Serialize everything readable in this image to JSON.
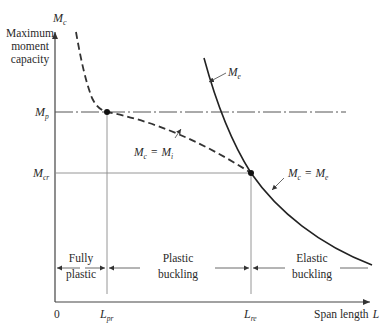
{
  "diagram": {
    "y_axis": {
      "symbol": "M",
      "symbol_sub": "c",
      "label_lines": [
        "Maximum",
        "moment",
        "capacity"
      ]
    },
    "x_axis": {
      "origin": "0",
      "label": "Span length",
      "label_symbol": "L"
    },
    "y_levels": [
      {
        "symbol": "M",
        "sub": "p",
        "style": "dash-dot"
      },
      {
        "symbol": "M",
        "sub": "cr",
        "style": "thin"
      }
    ],
    "x_marks": [
      {
        "symbol": "L",
        "sub": "pr"
      },
      {
        "symbol": "L",
        "sub": "re"
      }
    ],
    "curves": [
      {
        "name": "inelastic",
        "style": "dashed",
        "label": "M_c = M_i",
        "label_parts": {
          "lhs": "M",
          "lhs_sub": "c",
          "eq": "=",
          "rhs": "M",
          "rhs_sub": "i"
        }
      },
      {
        "name": "elastic",
        "style": "solid",
        "label": "M_e",
        "label_parts": {
          "sym": "M",
          "sub": "e"
        }
      },
      {
        "name": "elastic-segment",
        "style": "solid",
        "label": "M_c = M_e",
        "label_parts": {
          "lhs": "M",
          "lhs_sub": "c",
          "eq": "=",
          "rhs": "M",
          "rhs_sub": "e"
        }
      }
    ],
    "regions": [
      {
        "lines": [
          "Fully",
          "plastic"
        ]
      },
      {
        "lines": [
          "Plastic",
          "buckling"
        ]
      },
      {
        "lines": [
          "Elastic",
          "buckling"
        ]
      }
    ]
  }
}
